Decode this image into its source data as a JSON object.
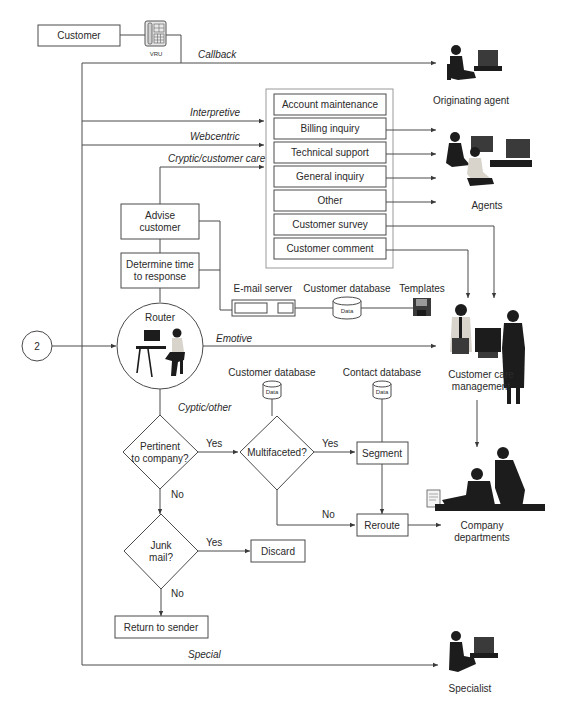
{
  "nodes": {
    "customer": "Customer",
    "vru": "VRU",
    "advise_customer": [
      "Advise",
      "customer"
    ],
    "determine_time": [
      "Determine time",
      "to response"
    ],
    "router": "Router",
    "connector": "2",
    "pertinent": [
      "Pertinent",
      "to company?"
    ],
    "multifaceted": "Multifaceted?",
    "segment": "Segment",
    "reroute": "Reroute",
    "junk_mail": [
      "Junk",
      "mail?"
    ],
    "discard": "Discard",
    "return_to_sender": "Return to sender"
  },
  "categories": [
    "Account maintenance",
    "Billing inquiry",
    "Technical support",
    "General inquiry",
    "Other",
    "Customer survey",
    "Customer comment"
  ],
  "resources": {
    "email_server": "E-mail server",
    "customer_database_top": "Customer database",
    "templates": "Templates",
    "customer_database_mid": "Customer database",
    "contact_database": "Contact database",
    "db_label": "Data"
  },
  "routes": {
    "callback": "Callback",
    "interpretive": "Interpretive",
    "webcentric": "Webcentric",
    "cryptic_customer_care": "Cryptic/customer care",
    "emotive": "Emotive",
    "cryptic_other": "Cyptic/other",
    "special": "Special"
  },
  "decisions": {
    "yes": "Yes",
    "no": "No"
  },
  "destinations": {
    "originating_agent": "Originating agent",
    "agents": "Agents",
    "customer_care_management": [
      "Customer care",
      "management"
    ],
    "company_departments": [
      "Company",
      "departments"
    ],
    "specialist": "Specialist"
  }
}
